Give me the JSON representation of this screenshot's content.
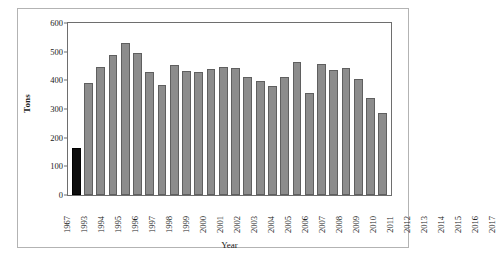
{
  "chart_data": {
    "type": "bar",
    "title": "",
    "xlabel": "Year",
    "ylabel": "Tons",
    "ylim": [
      0,
      600
    ],
    "yticks": [
      0,
      100,
      200,
      300,
      400,
      500,
      600
    ],
    "grid": false,
    "legend": null,
    "categories": [
      "1967",
      "1993",
      "1994",
      "1995",
      "1996",
      "1997",
      "1998",
      "1999",
      "2000",
      "2001",
      "2002",
      "2003",
      "2004",
      "2005",
      "2006",
      "2007",
      "2008",
      "2009",
      "2010",
      "2011",
      "2012",
      "2013",
      "2014",
      "2015",
      "2016",
      "2017"
    ],
    "values": [
      165,
      392,
      445,
      487,
      532,
      495,
      430,
      383,
      455,
      432,
      430,
      440,
      448,
      443,
      410,
      398,
      382,
      410,
      465,
      355,
      458,
      435,
      443,
      403,
      340,
      285
    ],
    "series": [
      {
        "name": "Tons",
        "values": [
          165,
          392,
          445,
          487,
          532,
          495,
          430,
          383,
          455,
          432,
          430,
          440,
          448,
          443,
          410,
          398,
          382,
          410,
          465,
          355,
          458,
          435,
          443,
          403,
          340,
          285
        ]
      }
    ],
    "highlight_category": "1967",
    "colors": {
      "bar": "#8c8c8c",
      "bar_edge": "#5f5f5f",
      "highlight_bar": "#0d0d0d",
      "axis": "#6e6e6e",
      "frame": "#b3b3b3",
      "background": "#ffffff",
      "text": "#1a1a1a"
    }
  }
}
